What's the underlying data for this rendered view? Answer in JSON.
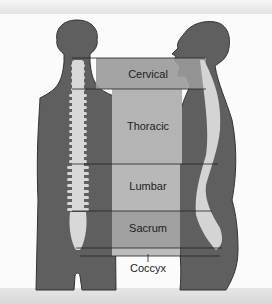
{
  "figure": {
    "title": "",
    "views": [
      "posterior view",
      "lateral view"
    ],
    "regions": [
      {
        "label": "Cervical",
        "fill": "#9a9a9a"
      },
      {
        "label": "Thoracic",
        "fill": "#b4b4b4"
      },
      {
        "label": "Lumbar",
        "fill": "#b8b8b8"
      },
      {
        "label": "Sacrum",
        "fill": "#a0a0a0"
      },
      {
        "label": "Coccyx",
        "fill": "#bdbdbd"
      }
    ],
    "colors": {
      "body": "#5f5f5f",
      "body_outline": "#333333",
      "bone": "#d8d8d8",
      "background": "#fbfbfb"
    }
  }
}
